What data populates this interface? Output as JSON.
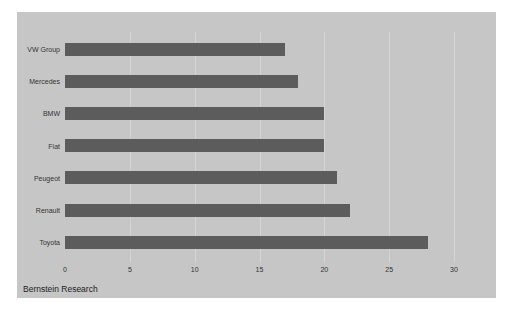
{
  "chart_data": {
    "type": "bar",
    "orientation": "horizontal",
    "title": "",
    "xlabel": "",
    "ylabel": "",
    "categories": [
      "VW Group",
      "Mercedes",
      "BMW",
      "Fiat",
      "Peugeot",
      "Renault",
      "Toyota"
    ],
    "values": [
      17,
      18,
      20,
      20,
      21,
      22,
      28
    ],
    "xlim": [
      0,
      30
    ],
    "xticks": [
      "0",
      "5",
      "10",
      "15",
      "20",
      "25",
      "30"
    ],
    "grid": true,
    "legend": null,
    "source": "Bernstein Research",
    "colors": {
      "bar": "#5c5c5c",
      "background": "#c6c6c6",
      "gridline": "#d4d4d4"
    }
  },
  "labels": {
    "cat0": "VW Group",
    "cat1": "Mercedes",
    "cat2": "BMW",
    "cat3": "Fiat",
    "cat4": "Peugeot",
    "cat5": "Renault",
    "cat6": "Toyota",
    "t0": "0",
    "t1": "5",
    "t2": "10",
    "t3": "15",
    "t4": "20",
    "t5": "25",
    "t6": "30",
    "source": "Bernstein Research"
  }
}
